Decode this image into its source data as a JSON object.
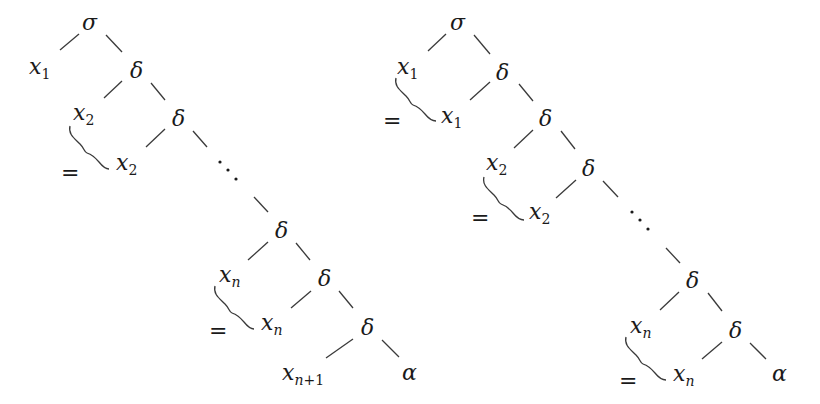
{
  "diagram": {
    "colors": {
      "ink": "#1a1a1a",
      "edge": "#3a3a3a",
      "background": "#ffffff"
    },
    "symbols": {
      "sigma": "σ",
      "delta": "δ",
      "alpha": "α",
      "equals": "=",
      "x": "x"
    },
    "left_tree": {
      "nodes": [
        {
          "id": "L-sigma",
          "label": "σ",
          "x": 90,
          "y": 22
        },
        {
          "id": "L-x1",
          "label": "x",
          "sub": "1",
          "x": 40,
          "y": 66
        },
        {
          "id": "L-d1",
          "label": "δ",
          "x": 137,
          "y": 70
        },
        {
          "id": "L-x2",
          "label": "x",
          "sub": "2",
          "x": 86,
          "y": 113
        },
        {
          "id": "L-d2",
          "label": "δ",
          "x": 179,
          "y": 118
        },
        {
          "id": "L-x2b",
          "label": "x",
          "sub": "2",
          "x": 127,
          "y": 163
        },
        {
          "id": "L-dn",
          "label": "δ",
          "x": 282,
          "y": 230
        },
        {
          "id": "L-xn",
          "label": "x",
          "sub": "n",
          "x": 230,
          "y": 275
        },
        {
          "id": "L-dn1",
          "label": "δ",
          "x": 325,
          "y": 278
        },
        {
          "id": "L-xnb",
          "label": "x",
          "sub": "n",
          "x": 272,
          "y": 323
        },
        {
          "id": "L-dn2",
          "label": "δ",
          "x": 368,
          "y": 327
        },
        {
          "id": "L-xn1",
          "label": "x",
          "sub": "n+1",
          "x": 305,
          "y": 373
        },
        {
          "id": "L-alpha",
          "label": "α",
          "x": 410,
          "y": 373
        }
      ],
      "equals": [
        {
          "label": "=",
          "x": 70,
          "y": 174
        },
        {
          "label": "=",
          "x": 218,
          "y": 332
        }
      ],
      "ellipsis": {
        "x": 228,
        "y": 170
      }
    },
    "right_tree": {
      "nodes": [
        {
          "id": "R-sigma",
          "label": "σ",
          "x": 458,
          "y": 22
        },
        {
          "id": "R-x1",
          "label": "x",
          "sub": "1",
          "x": 408,
          "y": 66
        },
        {
          "id": "R-d1",
          "label": "δ",
          "x": 503,
          "y": 72
        },
        {
          "id": "R-x1b",
          "label": "x",
          "sub": "1",
          "x": 452,
          "y": 116
        },
        {
          "id": "R-d2",
          "label": "δ",
          "x": 546,
          "y": 118
        },
        {
          "id": "R-x2",
          "label": "x",
          "sub": "2",
          "x": 497,
          "y": 163
        },
        {
          "id": "R-d3",
          "label": "δ",
          "x": 589,
          "y": 168
        },
        {
          "id": "R-x2b",
          "label": "x",
          "sub": "2",
          "x": 540,
          "y": 212
        },
        {
          "id": "R-dn",
          "label": "δ",
          "x": 693,
          "y": 280
        },
        {
          "id": "R-xn",
          "label": "x",
          "sub": "n",
          "x": 641,
          "y": 326
        },
        {
          "id": "R-dn1",
          "label": "δ",
          "x": 736,
          "y": 330
        },
        {
          "id": "R-xnb",
          "label": "x",
          "sub": "n",
          "x": 684,
          "y": 374
        },
        {
          "id": "R-alpha",
          "label": "α",
          "x": 780,
          "y": 374
        }
      ],
      "equals": [
        {
          "label": "=",
          "x": 392,
          "y": 122
        },
        {
          "label": "=",
          "x": 480,
          "y": 219
        },
        {
          "label": "=",
          "x": 628,
          "y": 382
        }
      ],
      "ellipsis": {
        "x": 640,
        "y": 220
      }
    }
  }
}
